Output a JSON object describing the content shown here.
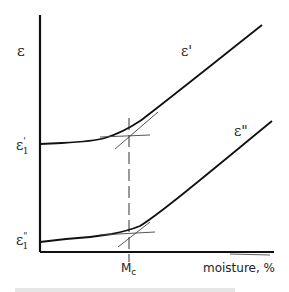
{
  "diagram": {
    "type": "schematic line plot (hand-drawn)",
    "y_axis_label": "ε",
    "x_axis_label": "moisture, %",
    "critical_marker_label": "M",
    "critical_marker_subscript": "c",
    "curves": [
      {
        "name": "ε'",
        "label": "ε'",
        "start_label": "ε",
        "start_label_sup": "'",
        "start_label_sub": "1"
      },
      {
        "name": "ε''",
        "label": "ε\"",
        "start_label": "ε",
        "start_label_sup": "\"",
        "start_label_sub": "1"
      }
    ],
    "caption": ""
  }
}
